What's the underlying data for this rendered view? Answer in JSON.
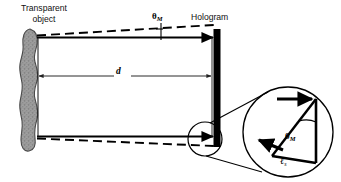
{
  "figure": {
    "domain": "diagram",
    "title_label": "Transparent object",
    "hologram_label": "Hologram",
    "distance_label": "d",
    "theta_symbol": "θ",
    "theta_subscript": "M",
    "ell_symbol": "ℓ",
    "ell_subscript": "s",
    "background_color": "#ffffff",
    "ink_color": "#000000",
    "blob_fill_color": "#9a9a9a",
    "blob_edge_color": "#3c3c3c"
  },
  "labels": {
    "transparent_object_line1": "Transparent",
    "transparent_object_line2": "object",
    "hologram": "Hologram",
    "distance": "d",
    "theta_top": "θ",
    "theta_top_sub": "M",
    "theta_inset": "θ",
    "theta_inset_sub": "M",
    "ell_inset": "ℓ",
    "ell_inset_sub": "s"
  },
  "geometry": {
    "object_blob": {
      "center_x": 30,
      "top_y": 30,
      "bottom_y": 150,
      "width": 22
    },
    "hologram_bar": {
      "x": 214,
      "top_y": 30,
      "bottom_y": 146,
      "thickness": 7
    },
    "top_ray": {
      "x1": 38,
      "y1": 37,
      "x2": 214,
      "y2": 37
    },
    "bottom_ray": {
      "x1": 38,
      "y1": 137,
      "x2": 214,
      "y2": 137
    },
    "dimension_line": {
      "x1": 38,
      "y1": 76,
      "x2": 210,
      "y2": 76
    },
    "angle_marker_x": 160,
    "source_circle": {
      "cx": 205,
      "cy": 139,
      "r": 17
    },
    "magnifier_circle": {
      "cx": 288,
      "cy": 132,
      "r": 45
    },
    "inset_triangle": {
      "apex_top_right": [
        316,
        99
      ],
      "apex_bottom_right": [
        316,
        163
      ],
      "apex_left": [
        272,
        155
      ]
    }
  }
}
